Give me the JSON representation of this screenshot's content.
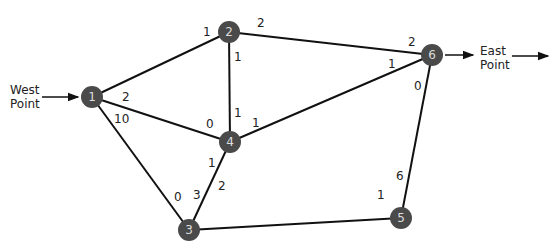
{
  "diagram": {
    "type": "network-flow-graph",
    "source_label": "West\nPoint",
    "sink_label": "East\nPoint",
    "node_color": "#4a4a4a",
    "edge_color": "#111111",
    "nodes": [
      {
        "id": "1",
        "x": 92,
        "y": 97
      },
      {
        "id": "2",
        "x": 229,
        "y": 32
      },
      {
        "id": "3",
        "x": 189,
        "y": 230
      },
      {
        "id": "4",
        "x": 230,
        "y": 142
      },
      {
        "id": "5",
        "x": 401,
        "y": 218
      },
      {
        "id": "6",
        "x": 432,
        "y": 55
      }
    ],
    "edges": [
      {
        "from": "1",
        "to": "2",
        "cap_from": "1",
        "cap_to": null
      },
      {
        "from": "1",
        "to": "4",
        "cap_from": "2",
        "cap_to": "0"
      },
      {
        "from": "1",
        "to": "3",
        "cap_from": "10",
        "cap_to": "0"
      },
      {
        "from": "2",
        "to": "6",
        "cap_from": "2",
        "cap_to": "2"
      },
      {
        "from": "2",
        "to": "4",
        "cap_from": "1",
        "cap_to": "1"
      },
      {
        "from": "4",
        "to": "6",
        "cap_from": "1",
        "cap_to": "1"
      },
      {
        "from": "4",
        "to": "3",
        "cap_from": "1",
        "cap_to": "3"
      },
      {
        "from": "3",
        "to": "5",
        "cap_from": "2",
        "cap_to": "1"
      },
      {
        "from": "5",
        "to": "6",
        "cap_from": "6",
        "cap_to": "0"
      }
    ],
    "edge_labels": [
      {
        "text": "1",
        "x": 203,
        "y": 26
      },
      {
        "text": "2",
        "x": 257,
        "y": 17
      },
      {
        "text": "1",
        "x": 234,
        "y": 51
      },
      {
        "text": "2",
        "x": 408,
        "y": 36
      },
      {
        "text": "1",
        "x": 388,
        "y": 58
      },
      {
        "text": "0",
        "x": 414,
        "y": 80
      },
      {
        "text": "2",
        "x": 122,
        "y": 91
      },
      {
        "text": "10",
        "x": 114,
        "y": 113
      },
      {
        "text": "0",
        "x": 206,
        "y": 118
      },
      {
        "text": "1",
        "x": 234,
        "y": 107
      },
      {
        "text": "1",
        "x": 252,
        "y": 117
      },
      {
        "text": "1",
        "x": 208,
        "y": 157
      },
      {
        "text": "0",
        "x": 174,
        "y": 191
      },
      {
        "text": "3",
        "x": 193,
        "y": 189
      },
      {
        "text": "2",
        "x": 218,
        "y": 180
      },
      {
        "text": "6",
        "x": 396,
        "y": 170
      },
      {
        "text": "1",
        "x": 377,
        "y": 189
      }
    ]
  }
}
